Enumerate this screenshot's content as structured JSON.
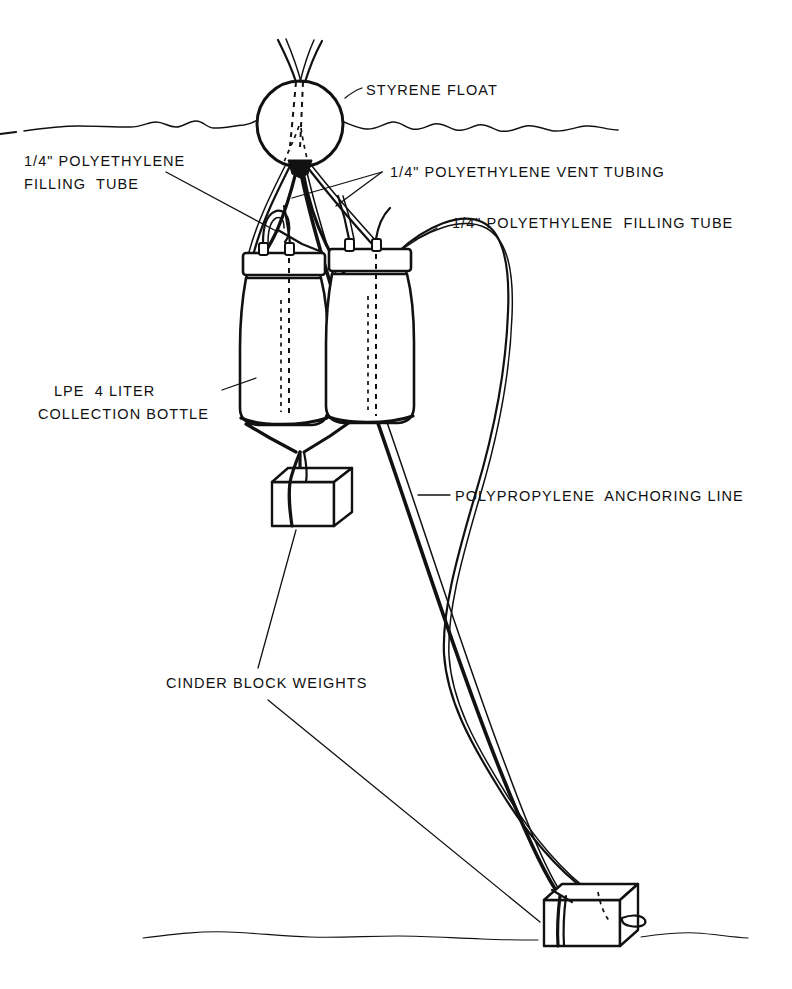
{
  "figure": {
    "kind": "technical-line-diagram",
    "background_color": "#ffffff",
    "ink_color": "#111111"
  },
  "labels": {
    "styrene_float": "STYRENE FLOAT",
    "filling_tube_left_line1": "1/4\" POLYETHYLENE",
    "filling_tube_left_line2": "FILLING  TUBE",
    "vent_tubing": "1/4\" POLYETHYLENE VENT TUBING",
    "filling_tube_right": "1/4\" POLYETHYLENE  FILLING TUBE",
    "collection_bottle_line1": "LPE  4 LITER",
    "collection_bottle_line2": "COLLECTION BOTTLE",
    "anchoring_line": "POLYPROPYLENE  ANCHORING LINE",
    "cinder_block_weights": "CINDER BLOCK WEIGHTS"
  },
  "components": {
    "float": {
      "name": "styrene-float",
      "shape": "circle",
      "center_x": 300,
      "center_y": 124,
      "radius": 43
    },
    "water_surface": {
      "name": "water-surface-line",
      "style": "wavy",
      "y": 125
    },
    "seafloor": {
      "name": "seafloor-line",
      "style": "wavy-thin",
      "y": 930
    },
    "bottles": [
      {
        "name": "collection-bottle-left",
        "x": 238,
        "y": 258,
        "width": 88,
        "height": 165,
        "capacity": "4 LITER",
        "material": "LPE"
      },
      {
        "name": "collection-bottle-right",
        "x": 327,
        "y": 252,
        "width": 85,
        "height": 172,
        "capacity": "4 LITER",
        "material": "LPE"
      }
    ],
    "cinder_blocks": [
      {
        "name": "cinder-block-upper",
        "x": 272,
        "y": 466,
        "width": 82,
        "height": 60
      },
      {
        "name": "cinder-block-lower",
        "x": 544,
        "y": 884,
        "width": 92,
        "height": 62
      }
    ],
    "tubes": [
      {
        "name": "filling-tube-left",
        "diameter": "1/4\"",
        "material": "POLYETHYLENE"
      },
      {
        "name": "vent-tube-left",
        "diameter": "1/4\"",
        "material": "POLYETHYLENE"
      },
      {
        "name": "vent-tube-right",
        "diameter": "1/4\"",
        "material": "POLYETHYLENE"
      },
      {
        "name": "filling-tube-right",
        "diameter": "1/4\"",
        "material": "POLYETHYLENE"
      }
    ],
    "anchoring_line": {
      "name": "polypropylene-anchoring-line",
      "material": "POLYPROPYLENE",
      "from": "styrene-float",
      "to": "cinder-block-lower"
    }
  }
}
